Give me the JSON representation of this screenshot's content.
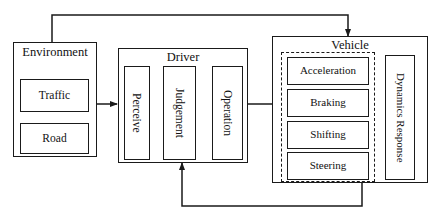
{
  "diagram": {
    "background_color": "#ffffff",
    "line_color": "#1a1a1a"
  },
  "environment": {
    "title": "Environment",
    "items": [
      {
        "label": "Traffic"
      },
      {
        "label": "Road"
      }
    ]
  },
  "driver": {
    "title": "Driver",
    "stages": [
      {
        "label": "Perceive"
      },
      {
        "label": "Judgement"
      },
      {
        "label": "Operation"
      }
    ]
  },
  "vehicle": {
    "title": "Vehicle",
    "controls": [
      {
        "label": "Acceleration"
      },
      {
        "label": "Braking"
      },
      {
        "label": "Shifting"
      },
      {
        "label": "Steering"
      }
    ],
    "dynamics": {
      "label": "Dynamics Response"
    }
  },
  "connectors": [
    {
      "name": "environment-to-driver",
      "from": "Environment",
      "to": "Driver"
    },
    {
      "name": "perceive-to-judgement",
      "from": "Perceive",
      "to": "Judgement"
    },
    {
      "name": "judgement-to-operation",
      "from": "Judgement",
      "to": "Operation"
    },
    {
      "name": "driver-to-vehicle",
      "from": "Operation",
      "to": "Vehicle"
    },
    {
      "name": "environment-to-vehicle-feedback",
      "from": "Environment",
      "to": "Vehicle"
    },
    {
      "name": "vehicle-to-driver-feedback",
      "from": "Vehicle",
      "to": "Driver"
    }
  ]
}
